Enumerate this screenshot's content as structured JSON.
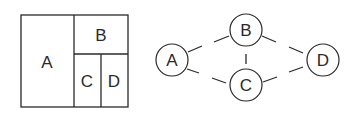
{
  "partition": {
    "regions": [
      {
        "id": "A",
        "label": "A"
      },
      {
        "id": "B",
        "label": "B"
      },
      {
        "id": "C",
        "label": "C"
      },
      {
        "id": "D",
        "label": "D"
      }
    ]
  },
  "graph": {
    "nodes": [
      {
        "id": "A",
        "label": "A"
      },
      {
        "id": "B",
        "label": "B"
      },
      {
        "id": "C",
        "label": "C"
      },
      {
        "id": "D",
        "label": "D"
      }
    ],
    "edges": [
      {
        "from": "A",
        "to": "B",
        "style": "dashed"
      },
      {
        "from": "A",
        "to": "C",
        "style": "dashed"
      },
      {
        "from": "B",
        "to": "C",
        "style": "dashed"
      },
      {
        "from": "B",
        "to": "D",
        "style": "dashed"
      },
      {
        "from": "C",
        "to": "D",
        "style": "dashed"
      }
    ]
  },
  "colors": {
    "stroke": "#2a2a2a",
    "background": "#ffffff"
  }
}
